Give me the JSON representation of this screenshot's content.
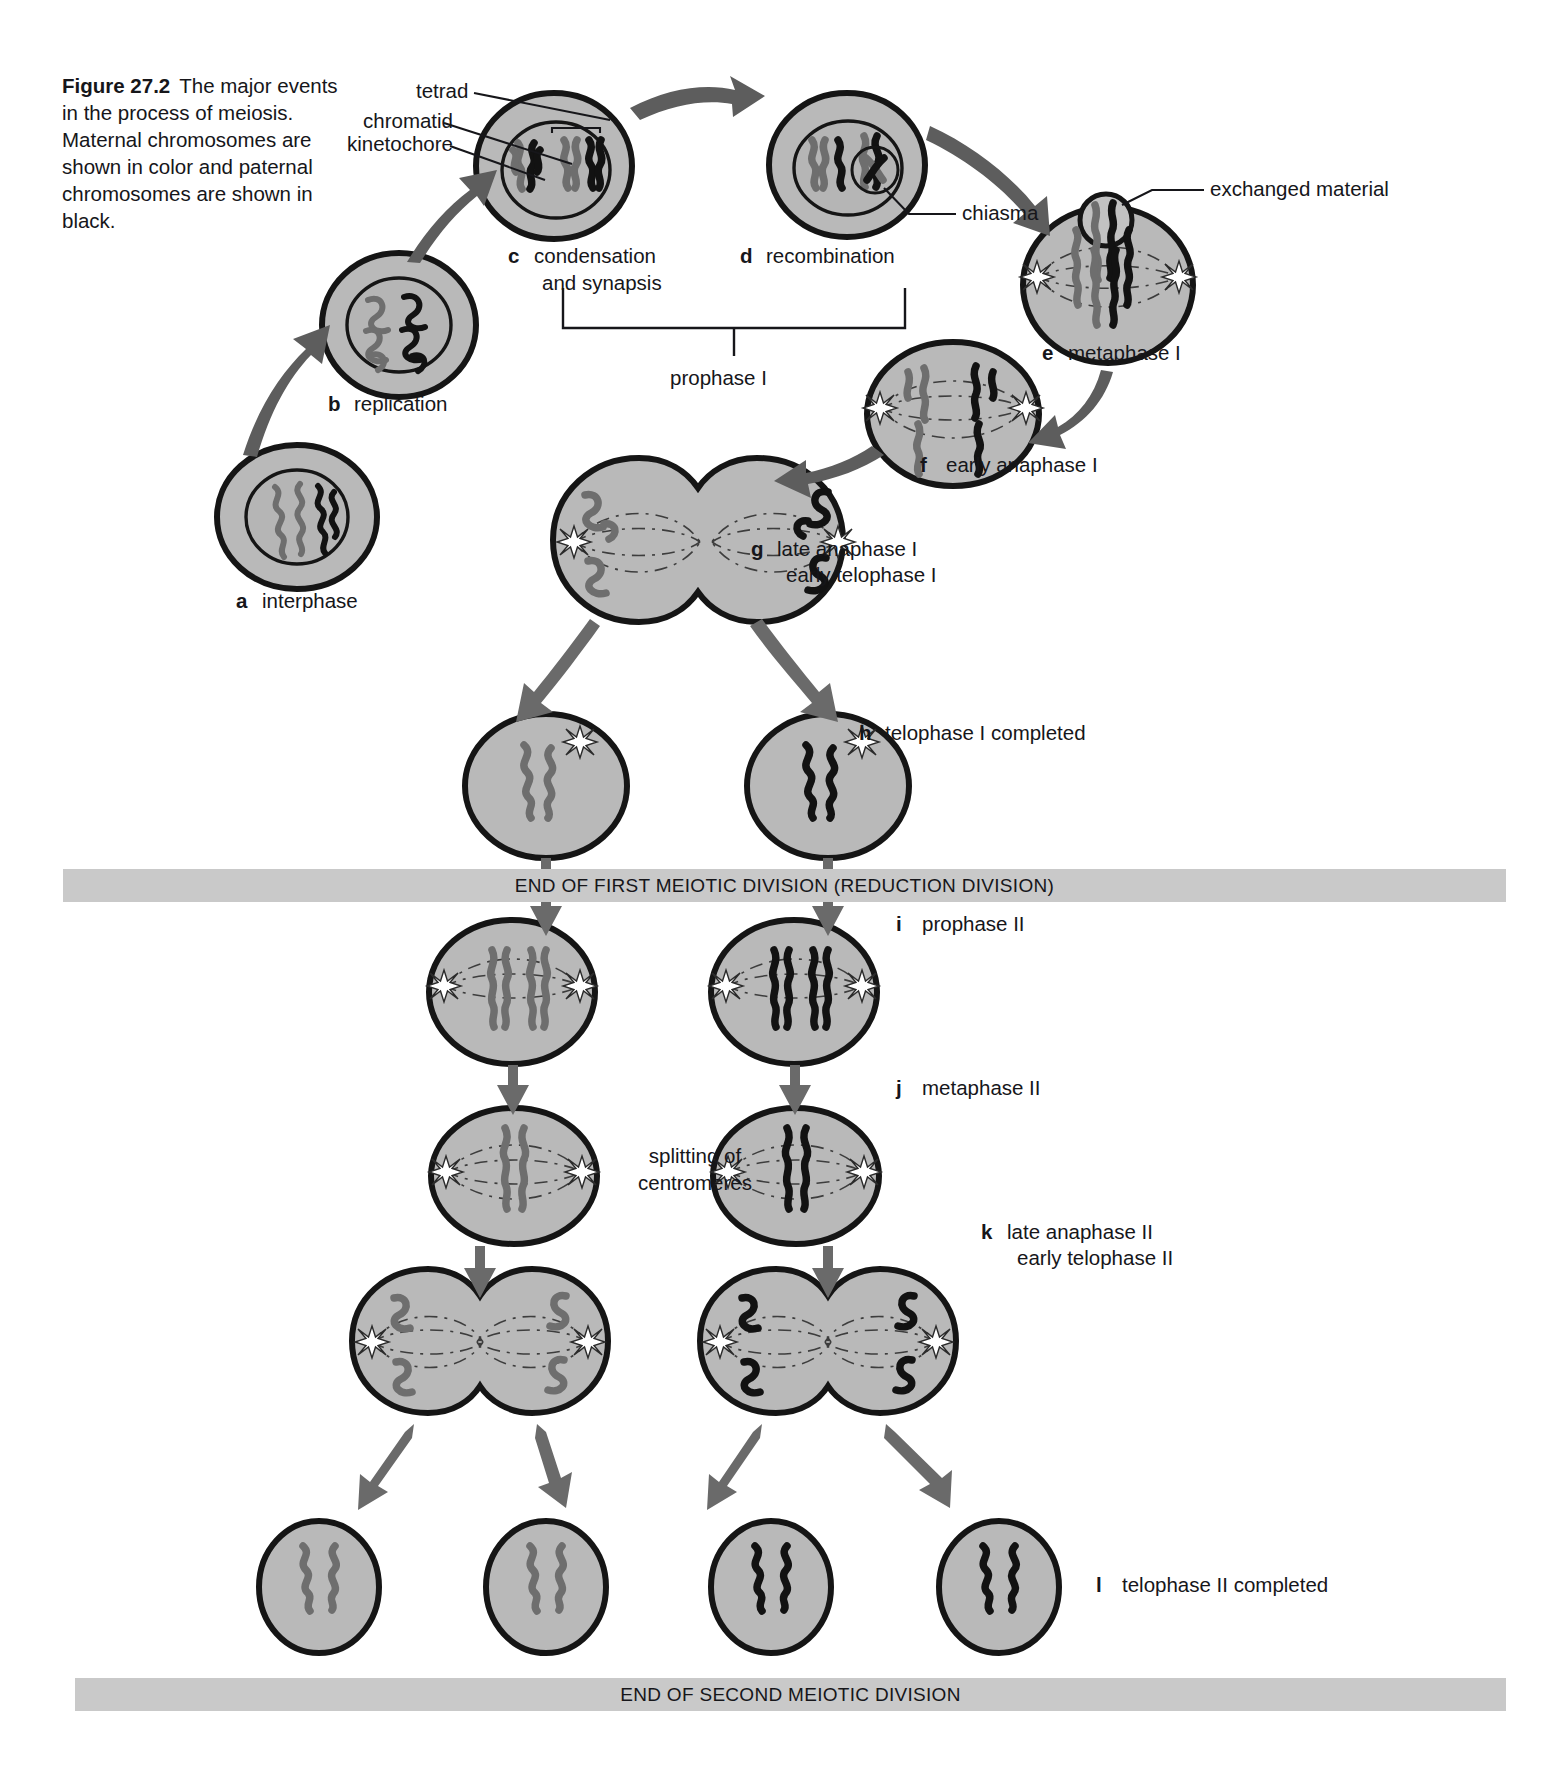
{
  "figure": {
    "number": "Figure 27.2",
    "caption": "The major events in the process of meiosis. Maternal chromosomes are shown in color and paternal chromosomes are shown in black."
  },
  "callouts": [
    {
      "id": "tetrad",
      "text": "tetrad"
    },
    {
      "id": "chromatid",
      "text": "chromatid"
    },
    {
      "id": "kinetochore",
      "text": "kinetochore"
    },
    {
      "id": "chiasma",
      "text": "chiasma"
    },
    {
      "id": "exchanged-material",
      "text": "exchanged material"
    }
  ],
  "stages": [
    {
      "key": "a",
      "label": "interphase"
    },
    {
      "key": "b",
      "label": "replication"
    },
    {
      "key": "c",
      "label": "condensation and synapsis",
      "line1": "condensation",
      "line2": "and synapsis"
    },
    {
      "key": "d",
      "label": "recombination"
    },
    {
      "key": "e",
      "label": "metaphase I"
    },
    {
      "key": "f",
      "label": "early anaphase I"
    },
    {
      "key": "g",
      "label": "late anaphase I / early telophase I",
      "line1": "late anaphase I",
      "line2": "early telophase I"
    },
    {
      "key": "h",
      "label": "telophase I completed"
    },
    {
      "key": "i",
      "label": "prophase II"
    },
    {
      "key": "j",
      "label": "metaphase II"
    },
    {
      "key": "k",
      "label": "late anaphase II / early telophase II",
      "line1": "late anaphase II",
      "line2": "early telophase II"
    },
    {
      "key": "l",
      "label": "telophase II completed"
    }
  ],
  "brackets": [
    {
      "id": "prophase-1",
      "text": "prophase I"
    }
  ],
  "annotations": [
    {
      "id": "splitting-of-centromeres",
      "line1": "splitting of",
      "line2": "centromeres"
    }
  ],
  "banners": [
    {
      "id": "end-first-division",
      "text": "END OF FIRST MEIOTIC DIVISION (REDUCTION DIVISION)"
    },
    {
      "id": "end-second-division",
      "text": "END OF SECOND MEIOTIC DIVISION"
    }
  ],
  "colors": {
    "maternal_chromosome": "#6e6e6e",
    "paternal_chromosome": "#121212",
    "cytoplasm": "#b9b9b9",
    "banner_background": "#c9c9c9",
    "arrow": "#5d5d5d",
    "page_background": "#ffffff"
  }
}
